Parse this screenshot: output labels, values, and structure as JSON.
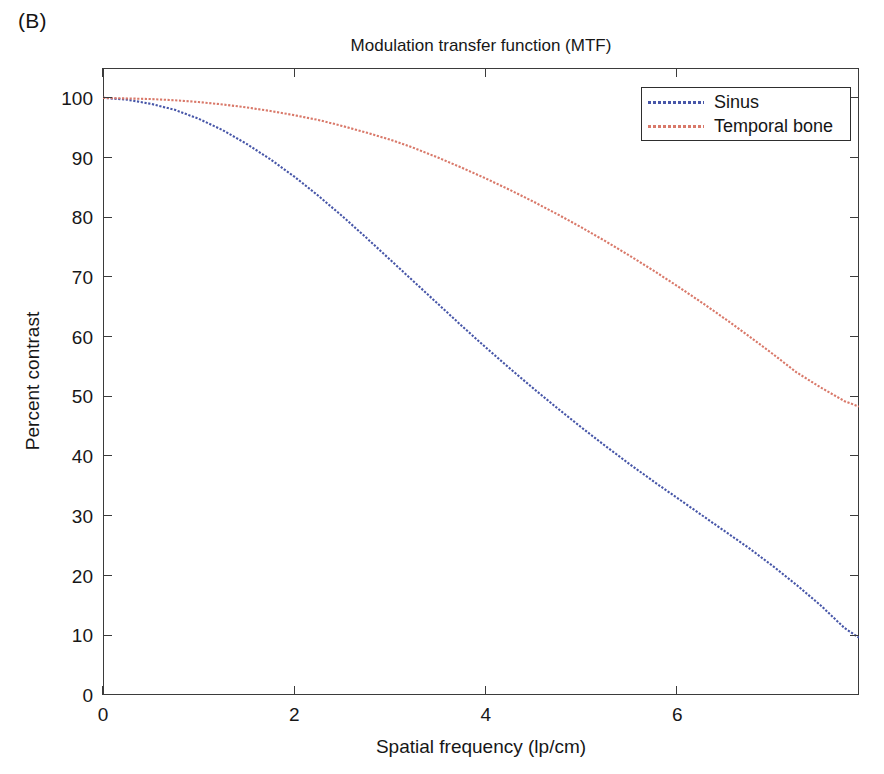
{
  "panel": {
    "label": "(B)"
  },
  "axis_label_texts": {
    "x": "Spatial frequency (lp/cm)",
    "y": "Percent contrast"
  },
  "legend": {
    "entries": [
      {
        "label": "Sinus",
        "color": "#4756a8",
        "style": "dotted"
      },
      {
        "label": "Temporal bone",
        "color": "#d9796a",
        "style": "dotted"
      }
    ]
  },
  "colors": {
    "sinus": "#4756a8",
    "temporal_bone": "#d9796a",
    "axis": "#3b3b3b",
    "text": "#171717",
    "background": "#ffffff"
  },
  "chart_data": {
    "type": "line",
    "title": "Modulation transfer function (MTF)",
    "xlabel": "Spatial frequency (lp/cm)",
    "ylabel": "Percent contrast",
    "xlim": [
      0,
      7.9
    ],
    "ylim": [
      0,
      105
    ],
    "xticks": [
      0,
      2,
      4,
      6
    ],
    "yticks": [
      0,
      10,
      20,
      30,
      40,
      50,
      60,
      70,
      80,
      90,
      100
    ],
    "xticklabels": [
      "0",
      "2",
      "4",
      "6"
    ],
    "yticklabels": [
      "0",
      "10",
      "20",
      "30",
      "40",
      "50",
      "60",
      "70",
      "80",
      "90",
      "100"
    ],
    "grid": false,
    "legend_position": "upper right",
    "x": [
      0,
      0.25,
      0.5,
      0.75,
      1.0,
      1.25,
      1.5,
      1.75,
      2.0,
      2.25,
      2.5,
      2.75,
      3.0,
      3.25,
      3.5,
      3.75,
      4.0,
      4.25,
      4.5,
      4.75,
      5.0,
      5.25,
      5.5,
      5.75,
      6.0,
      6.25,
      6.5,
      6.75,
      7.0,
      7.25,
      7.5,
      7.75,
      7.9
    ],
    "series": [
      {
        "name": "Sinus",
        "color": "#4756a8",
        "values": [
          100.0,
          99.7,
          99.0,
          98.0,
          96.5,
          94.6,
          92.3,
          89.7,
          86.8,
          83.6,
          80.2,
          76.6,
          72.9,
          69.2,
          65.5,
          61.8,
          58.2,
          54.7,
          51.3,
          48.0,
          44.8,
          41.7,
          38.7,
          35.8,
          33.0,
          30.2,
          27.4,
          24.6,
          21.6,
          18.4,
          15.0,
          11.2,
          9.6
        ]
      },
      {
        "name": "Temporal bone",
        "color": "#d9796a",
        "values": [
          100.0,
          99.9,
          99.8,
          99.6,
          99.3,
          98.9,
          98.4,
          97.8,
          97.1,
          96.3,
          95.3,
          94.2,
          93.0,
          91.6,
          90.0,
          88.3,
          86.5,
          84.6,
          82.6,
          80.5,
          78.3,
          76.0,
          73.6,
          71.1,
          68.5,
          65.8,
          63.0,
          60.1,
          57.1,
          54.0,
          51.5,
          49.2,
          48.3
        ]
      }
    ]
  }
}
